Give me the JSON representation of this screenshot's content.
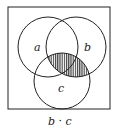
{
  "diagram": {
    "type": "venn",
    "sets": [
      {
        "label": "a",
        "cx": 48,
        "cy": 47,
        "r": 30
      },
      {
        "label": "b",
        "cx": 76,
        "cy": 47,
        "r": 30
      },
      {
        "label": "c",
        "cx": 62,
        "cy": 81,
        "r": 28
      }
    ],
    "shaded_region": "b ∩ c",
    "shading": "vertical-hatch",
    "caption": "b · c",
    "colors": {
      "stroke": "#222222",
      "background": "#ffffff"
    }
  }
}
